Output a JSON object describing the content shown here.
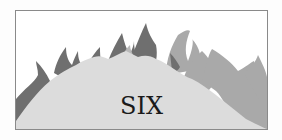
{
  "illustration": {
    "label": "SIX",
    "subject": "flames",
    "colors": {
      "border": "#8a8a8a",
      "background": "#ffffff",
      "flame_dark": "#6e6e6e",
      "flame_mid": "#a6a6a6",
      "flame_light": "#dcdcdc",
      "text": "#1a1a1a"
    }
  }
}
